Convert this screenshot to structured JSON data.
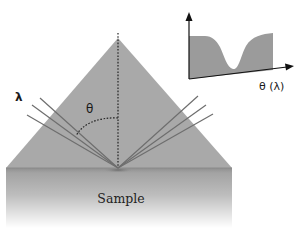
{
  "diagram": {
    "labels": {
      "wavelength": "λ",
      "angle": "θ",
      "sample": "Sample",
      "inset_xaxis": "θ (λ)"
    },
    "colors": {
      "prism": "#a9a9a9",
      "sample_top": "#9a9a9a",
      "sample_bottom": "#ffffff",
      "rays": "#6e6e6e",
      "inset_fill": "#9b9b9b",
      "axes": "#111111"
    },
    "geometry": {
      "prism": {
        "apex": [
          118,
          38
        ],
        "base_left": [
          6,
          168
        ],
        "base_right": [
          232,
          168
        ]
      },
      "focus_point": [
        118,
        168
      ],
      "incident_ray_starts": [
        [
          40,
          98
        ],
        [
          32,
          105
        ],
        [
          27,
          115
        ]
      ],
      "reflected_ray_ends": [
        [
          198,
          96
        ],
        [
          206,
          105
        ],
        [
          213,
          114
        ]
      ],
      "normal_line": {
        "from": [
          118,
          33
        ],
        "to": [
          118,
          168
        ]
      },
      "sample_block": {
        "x": 6,
        "y": 168,
        "width": 226,
        "height": 60
      }
    },
    "inset": {
      "description": "Reflectivity vs angle (or wavelength), showing resonance dip",
      "y_axis": {
        "from": [
          189,
          79
        ],
        "to": [
          189,
          13
        ]
      },
      "x_axis": {
        "from": [
          189,
          79
        ],
        "to": [
          293,
          66
        ]
      },
      "curve_profile": "flat high, sharp dip near center-right, returns high"
    }
  }
}
